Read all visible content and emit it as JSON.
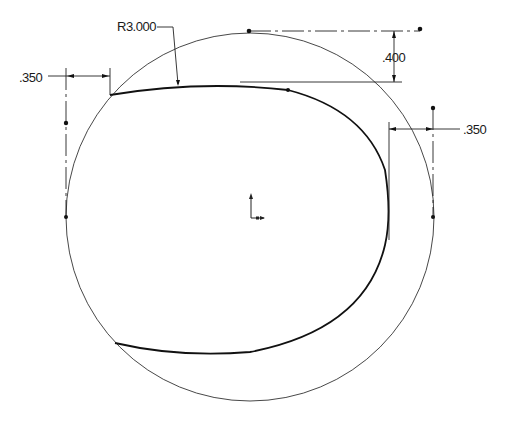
{
  "drawing": {
    "title": "Sphere sketch with split line",
    "dimensions": {
      "radius_label": "R3.000",
      "top_offset_label": ".400",
      "left_offset_label": ".350",
      "right_offset_label": ".350"
    },
    "colors": {
      "sphere_highlight": "#ffffff",
      "sphere_mid": "#b8b8b8",
      "sphere_shadow": "#3a3a3a",
      "line": "#111111",
      "background": "#ffffff"
    },
    "icons": {
      "origin": "origin-axis-icon"
    }
  }
}
